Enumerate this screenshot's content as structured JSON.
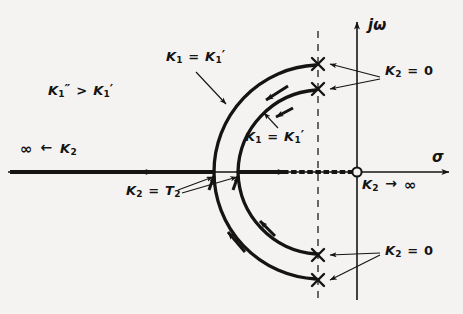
{
  "figure": {
    "type": "root-locus-diagram",
    "background_color": "#f4f3f1",
    "ink_color": "#141414"
  },
  "axes": {
    "real_axis_label": "σ",
    "imag_axis_label": "jω",
    "origin_marker": "open-circle-zero",
    "real_axis_y": 172,
    "imag_axis_x": 357,
    "dashed_vertical_x": 318
  },
  "legend": {
    "inequality_prefix": "K",
    "inequality_sub": "1",
    "inequality_double_prime": "″",
    "inequality_operator": ">",
    "inequality_suffix_sub": "1",
    "inequality_single_prime": "′",
    "inequality_text": "K₁″ > K₁′"
  },
  "labels": [
    {
      "id": "outer-branch-gain",
      "base": "K",
      "sub": "1",
      "eq": "=",
      "base2": "K",
      "sub2": "1",
      "prime": "′",
      "text": "K₁ = K₁′",
      "x": 166,
      "y": 55
    },
    {
      "id": "inner-branch-gain",
      "base": "K",
      "sub": "1",
      "eq": "=",
      "base2": "K",
      "sub2": "1",
      "prime": "′",
      "text": "K₁ = K₁′",
      "x": 245,
      "y": 132
    },
    {
      "id": "left-asymptote-gain",
      "text": "∞ ← K₂",
      "infinity": "∞",
      "arrow": "←",
      "base": "K",
      "sub": "2",
      "x": 22,
      "y": 143
    },
    {
      "id": "breakaway-gain",
      "text": "K₂ = T₂",
      "base": "K",
      "sub": "2",
      "eq": "=",
      "base2": "T",
      "sub2": "2",
      "x": 126,
      "y": 187
    },
    {
      "id": "origin-gain",
      "text": "K₂ → ∞",
      "base": "K",
      "sub": "2",
      "arrow": "→",
      "infinity": "∞",
      "x": 362,
      "y": 177
    },
    {
      "id": "upper-poles-gain",
      "text": "K₂ = 0",
      "base": "K",
      "sub": "2",
      "eq": "=",
      "value": "0",
      "x": 385,
      "y": 70
    },
    {
      "id": "lower-poles-gain",
      "text": "K₂ = 0",
      "base": "K",
      "sub": "2",
      "eq": "=",
      "value": "0",
      "x": 385,
      "y": 250
    }
  ],
  "poles": [
    {
      "id": "pole-upper-outer",
      "marker": "x",
      "x": 318,
      "y": 64
    },
    {
      "id": "pole-upper-inner",
      "marker": "x",
      "x": 318,
      "y": 89
    },
    {
      "id": "pole-lower-inner",
      "marker": "x",
      "x": 318,
      "y": 255
    },
    {
      "id": "pole-lower-outer",
      "marker": "x",
      "x": 318,
      "y": 280
    }
  ],
  "zeros": [
    {
      "id": "zero-origin",
      "marker": "o",
      "x": 357,
      "y": 172
    }
  ],
  "loci": [
    {
      "id": "outer-locus",
      "breakaway_x": 214,
      "radius": 107
    },
    {
      "id": "inner-locus",
      "breakaway_x": 238,
      "radius": 84
    },
    {
      "id": "real-axis-locus-left",
      "from_x": 214,
      "to_x": 10
    },
    {
      "id": "real-axis-locus-right",
      "from_x": 238,
      "to_x": 357
    }
  ]
}
